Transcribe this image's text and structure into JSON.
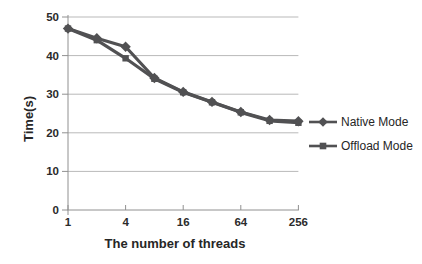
{
  "figure": {
    "background": "#ffffff"
  },
  "colors": {
    "series": "#515153",
    "grid": "#b9b9b9",
    "axis": "#909090",
    "text": "#262626"
  },
  "chart_data": {
    "type": "line",
    "title": "",
    "xlabel": "The number of threads",
    "ylabel": "Time(s)",
    "x_axis_scale": "log2",
    "x": [
      1,
      2,
      4,
      8,
      16,
      32,
      64,
      128,
      256
    ],
    "x_ticks": [
      1,
      4,
      16,
      64,
      256
    ],
    "y_ticks": [
      0,
      10,
      20,
      30,
      40,
      50
    ],
    "ylim": [
      0,
      50
    ],
    "grid": "horizontal",
    "legend_position": "right",
    "series": [
      {
        "name": "Native Mode",
        "marker": "diamond",
        "color": "#515153",
        "values": [
          47,
          44.5,
          42.3,
          34.2,
          30.6,
          28,
          25.4,
          23.3,
          23
        ]
      },
      {
        "name": "Offload Mode",
        "marker": "square",
        "color": "#515153",
        "values": [
          47,
          44,
          39.3,
          34,
          30.5,
          27.9,
          25.3,
          23.1,
          22.6
        ]
      }
    ]
  }
}
